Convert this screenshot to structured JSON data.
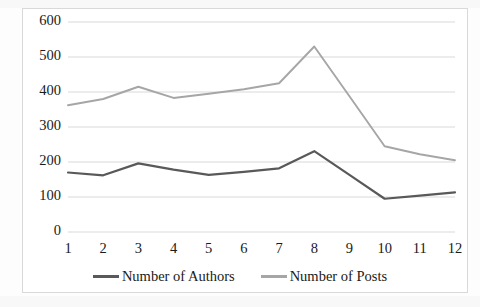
{
  "chart_data": {
    "type": "line",
    "title": "",
    "xlabel": "",
    "ylabel": "",
    "x": [
      1,
      2,
      3,
      4,
      5,
      6,
      7,
      8,
      9,
      10,
      11,
      12
    ],
    "categories": [
      "1",
      "2",
      "3",
      "4",
      "5",
      "6",
      "7",
      "8",
      "9",
      "10",
      "11",
      "12"
    ],
    "series": [
      {
        "name": "Number of Authors",
        "color": "#595959",
        "values": [
          170,
          162,
          196,
          178,
          163,
          172,
          182,
          231,
          163,
          95,
          104,
          113
        ]
      },
      {
        "name": "Number of Posts",
        "color": "#a6a6a6",
        "values": [
          362,
          380,
          415,
          383,
          395,
          408,
          425,
          530,
          388,
          245,
          222,
          205
        ]
      }
    ],
    "ylim": [
      0,
      600
    ],
    "yticks": [
      0,
      100,
      200,
      300,
      400,
      500,
      600
    ],
    "ytick_labels": [
      "0",
      "100",
      "200",
      "300",
      "400",
      "500",
      "600"
    ],
    "grid": true,
    "legend_position": "bottom"
  },
  "legend": {
    "entries": [
      {
        "label": "Number of Authors",
        "color": "#595959"
      },
      {
        "label": "Number of Posts",
        "color": "#a6a6a6"
      }
    ]
  },
  "style": {
    "plot_background": "#ffffff",
    "frame_border": "#d9d9d9",
    "gridline_color": "#d9d9d9",
    "text_color": "#1a1a1a"
  }
}
